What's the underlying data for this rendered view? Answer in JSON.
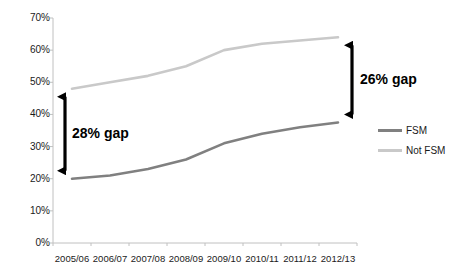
{
  "chart_data": {
    "type": "line",
    "title": "",
    "xlabel": "",
    "ylabel": "",
    "categories": [
      "2005/06",
      "2006/07",
      "2007/08",
      "2008/09",
      "2009/10",
      "2010/11",
      "2011/12",
      "2012/13"
    ],
    "series": [
      {
        "name": "FSM",
        "color": "#808080",
        "values": [
          20,
          21,
          23,
          26,
          31,
          34,
          36,
          37.5
        ]
      },
      {
        "name": "Not FSM",
        "color": "#c9c9c9",
        "values": [
          48,
          50,
          52,
          55,
          60,
          62,
          63,
          64
        ]
      }
    ],
    "ylim": [
      0,
      70
    ],
    "ytick_values": [
      0,
      10,
      20,
      30,
      40,
      50,
      60,
      70
    ],
    "ytick_labels": [
      "0%",
      "10%",
      "20%",
      "30%",
      "40%",
      "50%",
      "60%",
      "70%"
    ],
    "grid": false,
    "legend_position": "right",
    "annotations": [
      {
        "name": "left-gap",
        "label": "28% gap",
        "from_value": 48,
        "to_value": 20,
        "category": "2005/06"
      },
      {
        "name": "right-gap",
        "label": "26% gap",
        "from_value": 64,
        "to_value": 37.5,
        "category": "2012/13"
      }
    ]
  },
  "axis": {
    "line_color": "#c0c0c0",
    "tick_color": "#c0c0c0"
  },
  "annotation_color": "#000000",
  "legend": {
    "items": [
      {
        "label": "FSM",
        "color": "#808080"
      },
      {
        "label": "Not FSM",
        "color": "#c9c9c9"
      }
    ]
  }
}
